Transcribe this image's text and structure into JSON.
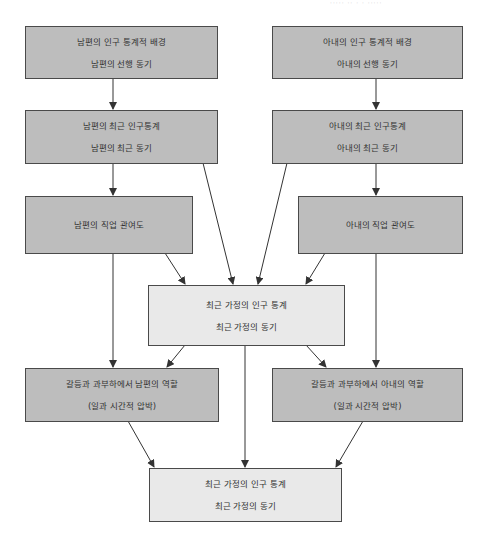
{
  "header": {
    "faint_text": "····· ·· · · ·····"
  },
  "colors": {
    "dark_box": "#bdbdbd",
    "light_box": "#e9e9e9",
    "border": "#4a4a4a",
    "arrow": "#333333"
  },
  "boxes": {
    "husband_background": {
      "line1": "남편의 인구 통계적 배경",
      "line2": "남편의 선행 동기"
    },
    "wife_background": {
      "line1": "아내의 인구 통계적 배경",
      "line2": "아내의 선행 동기"
    },
    "husband_recent": {
      "line1": "남편의 최근 인구통계",
      "line2": "남편의 최근 동기"
    },
    "wife_recent": {
      "line1": "아내의 최근 인구통계",
      "line2": "아내의 최근 동기"
    },
    "husband_job": {
      "line1": "남편의 직업 관여도"
    },
    "wife_job": {
      "line1": "아내의 직업 관여도"
    },
    "household_center": {
      "line1": "최근 가정의 인구 통계",
      "line2": "최근 가정의 동기"
    },
    "husband_conflict": {
      "line1": "갈등과 과부하에서 남편의 역할",
      "line2": "(일과 시간적 압박)"
    },
    "wife_conflict": {
      "line1": "갈등과 과부하에서 아내의 역할",
      "line2": "(일과 시간적 압박)"
    },
    "household_bottom": {
      "line1": "최근 가정의 인구 통계",
      "line2": "최근 가정의 동기"
    }
  }
}
